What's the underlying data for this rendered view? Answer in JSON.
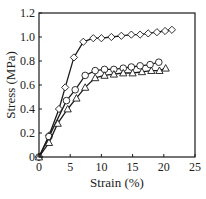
{
  "chart_data": {
    "type": "line",
    "title": "",
    "xlabel": "Strain (%)",
    "ylabel": "Stress (MPa)",
    "xlim": [
      0,
      25
    ],
    "ylim": [
      0,
      1.2
    ],
    "xticks": [
      0,
      5,
      10,
      15,
      20,
      25
    ],
    "yticks": [
      0,
      0.2,
      0.4,
      0.6,
      0.8,
      1.0,
      1.2
    ],
    "xtick_labels": [
      "0",
      "5",
      "10",
      "15",
      "20",
      "25"
    ],
    "ytick_labels": [
      "0",
      "0.2",
      "0.4",
      "0.6",
      "0.8",
      "1.0",
      "1.2"
    ],
    "grid": false,
    "legend": null,
    "series": [
      {
        "name": "diamond",
        "marker": "diamond",
        "x": [
          0,
          1.6,
          3.2,
          4.2,
          5.6,
          7.1,
          8.7,
          10.0,
          11.6,
          13.2,
          14.8,
          16.2,
          17.5,
          18.9,
          20.2,
          21.3
        ],
        "y": [
          0,
          0.18,
          0.4,
          0.58,
          0.83,
          0.96,
          0.99,
          0.99,
          1.0,
          1.01,
          1.02,
          1.02,
          1.03,
          1.04,
          1.05,
          1.06
        ]
      },
      {
        "name": "circle",
        "marker": "circle",
        "x": [
          0,
          1.6,
          4.4,
          5.8,
          7.4,
          9.0,
          10.5,
          12.0,
          13.5,
          14.8,
          16.2,
          17.8,
          19.2
        ],
        "y": [
          0,
          0.17,
          0.47,
          0.56,
          0.68,
          0.72,
          0.73,
          0.73,
          0.74,
          0.75,
          0.76,
          0.77,
          0.79
        ]
      },
      {
        "name": "triangle",
        "marker": "triangle",
        "x": [
          0,
          1.6,
          3.0,
          4.6,
          6.0,
          7.4,
          9.0,
          10.5,
          12.0,
          13.5,
          15.0,
          16.5,
          18.0,
          19.3,
          20.3
        ],
        "y": [
          0,
          0.12,
          0.28,
          0.4,
          0.49,
          0.58,
          0.66,
          0.68,
          0.69,
          0.7,
          0.7,
          0.71,
          0.72,
          0.72,
          0.74
        ]
      }
    ]
  },
  "layout": {
    "plot_left": 39,
    "plot_right": 195,
    "plot_top": 13,
    "plot_bottom": 157,
    "line_color": "#1a1a1a",
    "marker_fill": "#ffffff"
  }
}
